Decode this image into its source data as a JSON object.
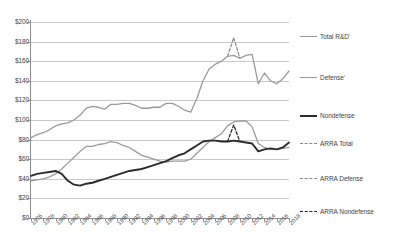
{
  "chart_data": {
    "type": "line",
    "title": "",
    "xlabel": "",
    "ylabel": "",
    "ylim": [
      0,
      200
    ],
    "ytick_step": 20,
    "xlim": [
      1976,
      2018
    ],
    "xtick_step": 2,
    "grid": true,
    "legend_position": "right",
    "ytick_labels": [
      "$200",
      "$180",
      "$160",
      "$140",
      "$120",
      "$100",
      "$80",
      "$60",
      "$40",
      "$20",
      "$0"
    ],
    "ytick_values": [
      200,
      180,
      160,
      140,
      120,
      100,
      80,
      60,
      40,
      20,
      0
    ],
    "xtick_labels": [
      "1976",
      "1978",
      "1980",
      "1982",
      "1984",
      "1986",
      "1988",
      "1990",
      "1992",
      "1994",
      "1996",
      "1998",
      "2000",
      "2002",
      "2004",
      "2006",
      "2008",
      "2010",
      "2012",
      "2014",
      "2016",
      "2018"
    ],
    "x": [
      1976,
      1977,
      1978,
      1979,
      1980,
      1981,
      1982,
      1983,
      1984,
      1985,
      1986,
      1987,
      1988,
      1989,
      1990,
      1991,
      1992,
      1993,
      1994,
      1995,
      1996,
      1997,
      1998,
      1999,
      2000,
      2001,
      2002,
      2003,
      2004,
      2005,
      2006,
      2007,
      2008,
      2009,
      2010,
      2011,
      2012,
      2013,
      2014,
      2015,
      2016,
      2017,
      2018
    ],
    "series": [
      {
        "name": "Total R&D'",
        "color": "#9a9a9a",
        "width": 1.3,
        "dash": "none",
        "values": [
          82,
          85,
          87,
          90,
          94,
          96,
          97,
          100,
          105,
          112,
          114,
          113,
          111,
          116,
          116,
          117,
          117,
          115,
          112,
          112,
          113,
          113,
          117,
          117,
          114,
          110,
          108,
          122,
          140,
          152,
          157,
          160,
          165,
          166,
          163,
          166,
          167,
          137,
          148,
          140,
          137,
          142,
          150
        ]
      },
      {
        "name": "Defense'",
        "color": "#9a9a9a",
        "width": 1.3,
        "dash": "none",
        "values": [
          38,
          39,
          40,
          42,
          45,
          50,
          56,
          62,
          68,
          73,
          73,
          75,
          76,
          78,
          77,
          74,
          72,
          68,
          64,
          62,
          60,
          58,
          57,
          58,
          58,
          58,
          60,
          66,
          72,
          78,
          82,
          86,
          94,
          98,
          99,
          99,
          93,
          76,
          72,
          70,
          70,
          71,
          72
        ]
      },
      {
        "name": "Nondefense",
        "color": "#2b2b2b",
        "width": 1.9,
        "dash": "none",
        "values": [
          43,
          45,
          46,
          47,
          48,
          45,
          38,
          34,
          33,
          35,
          36,
          38,
          40,
          42,
          44,
          46,
          48,
          49,
          50,
          52,
          54,
          56,
          58,
          61,
          64,
          66,
          70,
          74,
          78,
          79,
          79,
          78,
          78,
          79,
          78,
          77,
          76,
          68,
          70,
          71,
          70,
          72,
          77
        ]
      }
    ],
    "arra_series": [
      {
        "name": "ARRA Total",
        "color": "#8a8a8a",
        "width": 1.2,
        "dash": "3,2",
        "x": [
          2008,
          2009,
          2010
        ],
        "values": [
          165,
          184,
          163
        ]
      },
      {
        "name": "ARRA Defense",
        "color": "#8a8a8a",
        "width": 1.2,
        "dash": "3,2",
        "x": [],
        "values": []
      },
      {
        "name": "ARRA Nondefense",
        "color": "#2b2b2b",
        "width": 1.3,
        "dash": "3,2",
        "x": [
          2008,
          2009,
          2010
        ],
        "values": [
          78,
          95,
          78
        ]
      }
    ],
    "legend": [
      {
        "label": "Total R&D'",
        "color": "#9a9a9a",
        "dash": "none",
        "width": 1.4,
        "top": 31
      },
      {
        "label": "Defense'",
        "color": "#9a9a9a",
        "dash": "none",
        "width": 1.4,
        "top": 72
      },
      {
        "label": "Nondefense",
        "color": "#2b2b2b",
        "dash": "none",
        "width": 2.2,
        "top": 110
      },
      {
        "label": "ARRA Total",
        "color": "#8a8a8a",
        "dash": "3,2",
        "width": 1.2,
        "top": 138
      },
      {
        "label": "ARRA Defense",
        "color": "#8a8a8a",
        "dash": "3,2",
        "width": 1.2,
        "top": 173
      },
      {
        "label": "ARRA Nondefense",
        "color": "#2b2b2b",
        "dash": "3,2",
        "width": 1.4,
        "top": 206
      }
    ]
  }
}
